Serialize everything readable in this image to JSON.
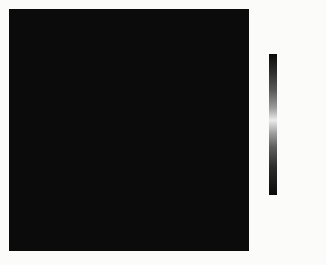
{
  "chart_data": {
    "type": "heatmap",
    "title": "",
    "xlabel": "",
    "ylabel": "",
    "grid_size": [
      17,
      17
    ],
    "colorbar": {
      "label": "温度/℃",
      "range": [
        307,
        312
      ],
      "ticks": [
        "312",
        "311",
        "310",
        "309",
        "308",
        "307"
      ],
      "colormap": "black-gray-white-gray-black (peak white ≈309.7)"
    },
    "intensity_note": "values are approximate gray intensity 0=black (extreme temp) .. 1=light gray (≈309.5 ℃)",
    "values": [
      [
        0.05,
        0.05,
        0.08,
        0.15,
        0.3,
        0.45,
        0.55,
        0.6,
        0.6,
        0.6,
        0.55,
        0.45,
        0.3,
        0.15,
        0.05,
        0.05,
        0.05
      ],
      [
        0.05,
        0.08,
        0.15,
        0.25,
        0.4,
        0.55,
        0.62,
        0.65,
        0.65,
        0.65,
        0.62,
        0.55,
        0.4,
        0.25,
        0.12,
        0.05,
        0.05
      ],
      [
        0.1,
        0.15,
        0.25,
        0.35,
        0.5,
        0.58,
        0.3,
        0.25,
        0.25,
        0.25,
        0.3,
        0.5,
        0.55,
        0.35,
        0.2,
        0.1,
        0.08
      ],
      [
        0.25,
        0.3,
        0.4,
        0.5,
        0.35,
        0.15,
        0.05,
        0.03,
        0.03,
        0.03,
        0.05,
        0.12,
        0.35,
        0.5,
        0.4,
        0.3,
        0.2
      ],
      [
        0.4,
        0.45,
        0.55,
        0.4,
        0.15,
        0.03,
        0.02,
        0.02,
        0.02,
        0.02,
        0.02,
        0.05,
        0.15,
        0.45,
        0.55,
        0.45,
        0.35
      ],
      [
        0.5,
        0.55,
        0.6,
        0.3,
        0.05,
        0.02,
        0.02,
        0.02,
        0.02,
        0.02,
        0.02,
        0.02,
        0.05,
        0.35,
        0.6,
        0.55,
        0.5
      ],
      [
        0.55,
        0.6,
        0.55,
        0.2,
        0.03,
        0.02,
        0.02,
        0.02,
        0.02,
        0.02,
        0.02,
        0.02,
        0.03,
        0.25,
        0.6,
        0.6,
        0.55
      ],
      [
        0.55,
        0.62,
        0.55,
        0.18,
        0.02,
        0.02,
        0.02,
        0.02,
        0.02,
        0.02,
        0.02,
        0.02,
        0.03,
        0.22,
        0.62,
        0.62,
        0.55
      ],
      [
        0.55,
        0.62,
        0.55,
        0.18,
        0.02,
        0.02,
        0.02,
        0.02,
        0.02,
        0.02,
        0.02,
        0.02,
        0.03,
        0.22,
        0.62,
        0.62,
        0.55
      ],
      [
        0.55,
        0.6,
        0.55,
        0.2,
        0.03,
        0.02,
        0.02,
        0.02,
        0.02,
        0.02,
        0.02,
        0.02,
        0.03,
        0.25,
        0.6,
        0.6,
        0.55
      ],
      [
        0.5,
        0.55,
        0.58,
        0.3,
        0.05,
        0.02,
        0.02,
        0.02,
        0.02,
        0.02,
        0.02,
        0.02,
        0.05,
        0.35,
        0.6,
        0.55,
        0.45
      ],
      [
        0.4,
        0.45,
        0.55,
        0.45,
        0.15,
        0.05,
        0.02,
        0.02,
        0.02,
        0.02,
        0.02,
        0.05,
        0.15,
        0.45,
        0.55,
        0.4,
        0.35
      ],
      [
        0.25,
        0.35,
        0.45,
        0.55,
        0.35,
        0.15,
        0.05,
        0.03,
        0.03,
        0.03,
        0.05,
        0.15,
        0.35,
        0.55,
        0.4,
        0.25,
        0.2
      ],
      [
        0.1,
        0.15,
        0.3,
        0.45,
        0.55,
        0.4,
        0.3,
        0.25,
        0.25,
        0.25,
        0.3,
        0.4,
        0.55,
        0.4,
        0.2,
        0.12,
        0.08
      ],
      [
        0.05,
        0.08,
        0.15,
        0.3,
        0.45,
        0.55,
        0.6,
        0.6,
        0.6,
        0.6,
        0.6,
        0.55,
        0.4,
        0.25,
        0.1,
        0.05,
        0.05
      ],
      [
        0.05,
        0.05,
        0.1,
        0.2,
        0.35,
        0.5,
        0.55,
        0.6,
        0.6,
        0.6,
        0.55,
        0.45,
        0.3,
        0.15,
        0.05,
        0.05,
        0.05
      ],
      [
        0.05,
        0.05,
        0.05,
        0.1,
        0.25,
        0.4,
        0.5,
        0.55,
        0.55,
        0.55,
        0.5,
        0.4,
        0.25,
        0.1,
        0.05,
        0.05,
        0.05
      ]
    ]
  }
}
